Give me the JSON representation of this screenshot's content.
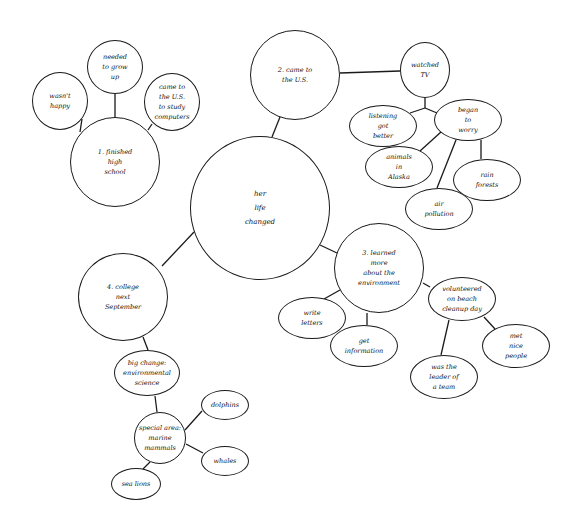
{
  "diagram": {
    "type": "idea-web",
    "style": {
      "stroke": "#1a1a1a",
      "background": "#ffffff"
    },
    "center": {
      "id": "center",
      "text": "her\nlife\nchanged",
      "shape": "circle",
      "cx": 260,
      "cy": 208,
      "rx": 70,
      "ry": 72
    },
    "nodes": [
      {
        "id": "n1",
        "text": "1. finished\nhigh\nschool",
        "shape": "circle",
        "cx": 115,
        "cy": 162,
        "rx": 45,
        "ry": 45
      },
      {
        "id": "n1a",
        "text": "wasn't\nhappy",
        "shape": "circle",
        "cx": 60,
        "cy": 101,
        "rx": 28,
        "ry": 29
      },
      {
        "id": "n1b",
        "text": "needed\nto grow\nup",
        "shape": "circle",
        "cx": 115,
        "cy": 67,
        "rx": 28,
        "ry": 27
      },
      {
        "id": "n1c",
        "text": "came to\nthe U.S.\nto study\ncomputers",
        "shape": "circle",
        "cx": 172,
        "cy": 102,
        "rx": 28,
        "ry": 29
      },
      {
        "id": "n2",
        "text": "2. came to\nthe U.S.",
        "shape": "circle",
        "cx": 295,
        "cy": 75,
        "rx": 45,
        "ry": 45
      },
      {
        "id": "n2a",
        "text": "watched\nTV",
        "shape": "circle",
        "cx": 425,
        "cy": 70,
        "rx": 25,
        "ry": 28
      },
      {
        "id": "n2b",
        "text": "listening\ngot\nbetter",
        "shape": "ellipse",
        "cx": 383,
        "cy": 126,
        "rx": 34,
        "ry": 21
      },
      {
        "id": "n2c",
        "text": "began\nto\nworry",
        "shape": "ellipse",
        "cx": 468,
        "cy": 120,
        "rx": 34,
        "ry": 21
      },
      {
        "id": "n2d",
        "text": "animals\nin\nAlaska",
        "shape": "ellipse",
        "cx": 399,
        "cy": 167,
        "rx": 34,
        "ry": 21
      },
      {
        "id": "n2e",
        "text": "rain\nforests",
        "shape": "ellipse",
        "cx": 487,
        "cy": 180,
        "rx": 34,
        "ry": 21
      },
      {
        "id": "n2f",
        "text": "air\npollution",
        "shape": "ellipse",
        "cx": 439,
        "cy": 209,
        "rx": 34,
        "ry": 21
      },
      {
        "id": "n3",
        "text": "3. learned\nmore\nabout the\nenvironment",
        "shape": "circle",
        "cx": 379,
        "cy": 268,
        "rx": 45,
        "ry": 45
      },
      {
        "id": "n3a",
        "text": "write\nletters",
        "shape": "ellipse",
        "cx": 312,
        "cy": 318,
        "rx": 34,
        "ry": 21
      },
      {
        "id": "n3b",
        "text": "get\ninformation",
        "shape": "ellipse",
        "cx": 364,
        "cy": 346,
        "rx": 34,
        "ry": 21
      },
      {
        "id": "n3c",
        "text": "volunteered\non beach\ncleanup day",
        "shape": "ellipse",
        "cx": 462,
        "cy": 299,
        "rx": 34,
        "ry": 22
      },
      {
        "id": "n3d",
        "text": "met\nnice\npeople",
        "shape": "ellipse",
        "cx": 516,
        "cy": 346,
        "rx": 34,
        "ry": 22
      },
      {
        "id": "n3e",
        "text": "was the\nleader of\na team",
        "shape": "ellipse",
        "cx": 444,
        "cy": 377,
        "rx": 34,
        "ry": 22
      },
      {
        "id": "n4",
        "text": "4. college\nnext\nSeptember",
        "shape": "circle",
        "cx": 123,
        "cy": 297,
        "rx": 45,
        "ry": 44
      },
      {
        "id": "n4a",
        "text": "big change:\nenvironmental\nscience",
        "shape": "ellipse",
        "cx": 147,
        "cy": 373,
        "rx": 33,
        "ry": 23
      },
      {
        "id": "n4b",
        "text": "special area:\nmarine\nmammals",
        "shape": "circle",
        "cx": 160,
        "cy": 438,
        "rx": 26,
        "ry": 26
      },
      {
        "id": "n4c",
        "text": "dolphins",
        "shape": "ellipse",
        "cx": 225,
        "cy": 405,
        "rx": 24,
        "ry": 15
      },
      {
        "id": "n4d",
        "text": "whales",
        "shape": "ellipse",
        "cx": 225,
        "cy": 461,
        "rx": 24,
        "ry": 15
      },
      {
        "id": "n4e",
        "text": "sea lions",
        "shape": "ellipse",
        "cx": 136,
        "cy": 484,
        "rx": 25,
        "ry": 16
      }
    ],
    "links": [
      {
        "from": "center",
        "to": "n2",
        "x1": 272,
        "y1": 137,
        "x2": 280,
        "y2": 117
      },
      {
        "from": "center",
        "to": "n3",
        "x1": 320,
        "y1": 245,
        "x2": 337,
        "y2": 253
      },
      {
        "from": "center",
        "to": "n4",
        "x1": 194,
        "y1": 232,
        "x2": 162,
        "y2": 266
      },
      {
        "from": "n1",
        "to": "n1a",
        "x1": 80,
        "y1": 132,
        "x2": 82,
        "y2": 119
      },
      {
        "from": "n1",
        "to": "n1b",
        "x1": 115,
        "y1": 117,
        "x2": 115,
        "y2": 94
      },
      {
        "from": "n1",
        "to": "n1c",
        "x1": 148,
        "y1": 130,
        "x2": 152,
        "y2": 124
      },
      {
        "from": "n2",
        "to": "n2a",
        "x1": 340,
        "y1": 73,
        "x2": 400,
        "y2": 71
      },
      {
        "from": "n2a",
        "to": "joint",
        "x1": 425,
        "y1": 98,
        "x2": 425,
        "y2": 108
      },
      {
        "from": "joint",
        "to": "n2b",
        "x1": 425,
        "y1": 108,
        "x2": 410,
        "y2": 113
      },
      {
        "from": "joint",
        "to": "n2c",
        "x1": 425,
        "y1": 108,
        "x2": 437,
        "y2": 113
      },
      {
        "from": "n2c",
        "to": "n2d",
        "x1": 441,
        "y1": 132,
        "x2": 420,
        "y2": 151
      },
      {
        "from": "n2c",
        "to": "n2e",
        "x1": 481,
        "y1": 140,
        "x2": 481,
        "y2": 159
      },
      {
        "from": "n2c",
        "to": "n2f",
        "x1": 456,
        "y1": 140,
        "x2": 437,
        "y2": 188
      },
      {
        "from": "n3",
        "to": "n3a",
        "x1": 340,
        "y1": 290,
        "x2": 324,
        "y2": 299
      },
      {
        "from": "n3",
        "to": "n3b",
        "x1": 367,
        "y1": 313,
        "x2": 367,
        "y2": 325
      },
      {
        "from": "n3",
        "to": "n3c",
        "x1": 423,
        "y1": 283,
        "x2": 430,
        "y2": 287
      },
      {
        "from": "n3c",
        "to": "n3d",
        "x1": 484,
        "y1": 317,
        "x2": 495,
        "y2": 329
      },
      {
        "from": "n3c",
        "to": "n3e",
        "x1": 449,
        "y1": 320,
        "x2": 441,
        "y2": 355
      },
      {
        "from": "n4",
        "to": "n4a",
        "x1": 143,
        "y1": 337,
        "x2": 148,
        "y2": 350
      },
      {
        "from": "n4a",
        "to": "n4b",
        "x1": 155,
        "y1": 396,
        "x2": 157,
        "y2": 412
      },
      {
        "from": "n4b",
        "to": "n4c",
        "x1": 185,
        "y1": 430,
        "x2": 202,
        "y2": 411
      },
      {
        "from": "n4b",
        "to": "n4d",
        "x1": 186,
        "y1": 444,
        "x2": 203,
        "y2": 453
      },
      {
        "from": "n4b",
        "to": "n4e",
        "x1": 150,
        "y1": 462,
        "x2": 143,
        "y2": 469
      }
    ]
  }
}
